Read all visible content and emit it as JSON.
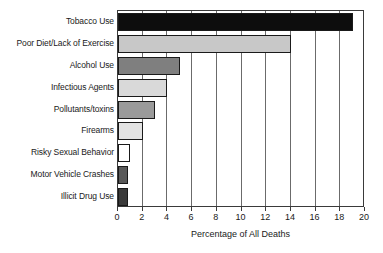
{
  "chart_data": {
    "type": "bar",
    "orientation": "horizontal",
    "title": "",
    "xlabel": "Percentage of All Deaths",
    "ylabel": "",
    "xlim": [
      0,
      20
    ],
    "xticks": [
      0,
      2,
      4,
      6,
      8,
      10,
      12,
      14,
      16,
      18,
      20
    ],
    "grid": "vertical",
    "legend": "none",
    "categories": [
      "Tobacco Use",
      "Poor Diet/Lack of Exercise",
      "Alcohol Use",
      "Infectious Agents",
      "Pollutants/toxins",
      "Firearms",
      "Risky Sexual Behavior",
      "Motor Vehicle Crashes",
      "Illicit Drug Use"
    ],
    "values": [
      19,
      14,
      5,
      4,
      3,
      2,
      1,
      0.8,
      0.8
    ],
    "bar_colors": [
      "#0d0d0d",
      "#c8c8c8",
      "#7f7f7f",
      "#d9d9d9",
      "#9a9a9a",
      "#e3e3e3",
      "#ffffff",
      "#595959",
      "#3a3a3a"
    ],
    "bar_edge_color": "#1a1a1a",
    "axis_color": "#3a3a3a",
    "gridline_color": "#6b6b6b",
    "background_color": "#ffffff"
  }
}
